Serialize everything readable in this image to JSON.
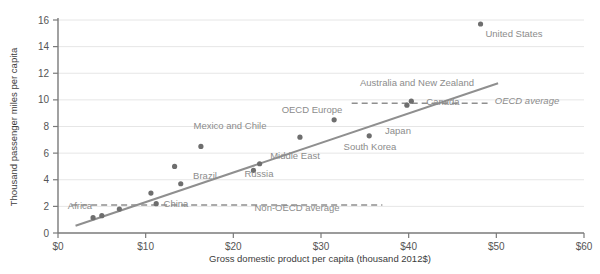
{
  "chart_data": {
    "type": "scatter",
    "title": "",
    "xlabel": "Gross domestic product per capita (thousand 2012$)",
    "ylabel": "Thousand passenger miles per capita",
    "xlim": [
      0,
      60
    ],
    "ylim": [
      0,
      16
    ],
    "xticks": [
      "$0",
      "$10",
      "$20",
      "$30",
      "$40",
      "$50",
      "$60"
    ],
    "xtick_values": [
      0,
      10,
      20,
      30,
      40,
      50,
      60
    ],
    "yticks": [
      "0",
      "2",
      "4",
      "6",
      "8",
      "10",
      "12",
      "14",
      "16"
    ],
    "ytick_values": [
      0,
      2,
      4,
      6,
      8,
      10,
      12,
      14,
      16
    ],
    "grid": true,
    "legend": "none",
    "points": [
      {
        "x": 4.0,
        "y": 1.15,
        "label": "Africa"
      },
      {
        "x": 5.0,
        "y": 1.3,
        "label": ""
      },
      {
        "x": 7.0,
        "y": 1.8,
        "label": ""
      },
      {
        "x": 10.6,
        "y": 3.0,
        "label": ""
      },
      {
        "x": 11.2,
        "y": 2.2,
        "label": "China"
      },
      {
        "x": 13.3,
        "y": 5.0,
        "label": ""
      },
      {
        "x": 14.0,
        "y": 3.7,
        "label": "Brazil"
      },
      {
        "x": 16.3,
        "y": 6.5,
        "label": "Mexico and Chile"
      },
      {
        "x": 22.3,
        "y": 4.7,
        "label": "Russia"
      },
      {
        "x": 23.0,
        "y": 5.2,
        "label": "Middle East"
      },
      {
        "x": 27.6,
        "y": 7.2,
        "label": "South Korea"
      },
      {
        "x": 31.5,
        "y": 8.5,
        "label": "OECD Europe"
      },
      {
        "x": 35.5,
        "y": 7.3,
        "label": "Japan"
      },
      {
        "x": 39.8,
        "y": 9.6,
        "label": "Canada"
      },
      {
        "x": 40.3,
        "y": 9.9,
        "label": "Australia and New Zealand"
      },
      {
        "x": 48.2,
        "y": 15.7,
        "label": "United States"
      }
    ],
    "trendline": {
      "x0": 2.0,
      "y0": 0.55,
      "x1": 50.2,
      "y1": 11.25
    },
    "reference_lines": [
      {
        "name": "OECD average",
        "value": 9.75,
        "x_start": 33.5,
        "x_end": 49.0,
        "label": "OECD average",
        "italic": true
      },
      {
        "name": "Non-OECD average",
        "value": 2.1,
        "x_start": 1.5,
        "x_end": 37.0,
        "label": "Non-OECD average",
        "italic": false
      }
    ],
    "annotations": [
      {
        "text": "United States",
        "x": 514,
        "y": 37,
        "anchor": "middle"
      },
      {
        "text": "Australia and New Zealand",
        "x": 417,
        "y": 86,
        "anchor": "middle"
      },
      {
        "text": "OECD average",
        "x": 527,
        "y": 104,
        "anchor": "middle"
      },
      {
        "text": "Canada",
        "x": 443,
        "y": 105,
        "anchor": "middle"
      },
      {
        "text": "OECD Europe",
        "x": 312,
        "y": 113,
        "anchor": "middle"
      },
      {
        "text": "Japan",
        "x": 398,
        "y": 134,
        "anchor": "middle"
      },
      {
        "text": "Mexico and Chile",
        "x": 230,
        "y": 129,
        "anchor": "middle"
      },
      {
        "text": "South Korea",
        "x": 370,
        "y": 150,
        "anchor": "middle"
      },
      {
        "text": "Middle East",
        "x": 295,
        "y": 159,
        "anchor": "middle"
      },
      {
        "text": "Brazil",
        "x": 205,
        "y": 179,
        "anchor": "middle"
      },
      {
        "text": "Russia",
        "x": 259,
        "y": 177,
        "anchor": "middle"
      },
      {
        "text": "Africa",
        "x": 80,
        "y": 209,
        "anchor": "middle"
      },
      {
        "text": "China",
        "x": 176,
        "y": 207,
        "anchor": "middle"
      },
      {
        "text": "Non-OECD average",
        "x": 297,
        "y": 211,
        "anchor": "middle"
      }
    ]
  },
  "axes": {
    "x_title": "Gross domestic product per capita (thousand 2012$)",
    "y_title": "Thousand passenger miles per capita"
  }
}
